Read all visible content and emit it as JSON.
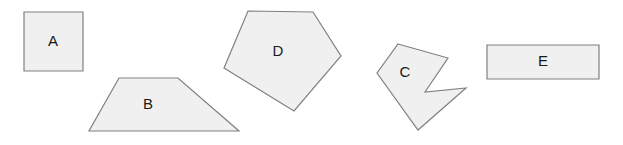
{
  "canvas": {
    "width": 623,
    "height": 145,
    "background_color": "#ffffff"
  },
  "style": {
    "fill_color": "#f0f0f0",
    "stroke_color": "#808080",
    "stroke_width": 1.2,
    "label_color": "#1a1a1a",
    "label_font_size": 15
  },
  "shapes": [
    {
      "id": "shape-a",
      "label": "A",
      "kind": "square",
      "points": "24,12 83,12 83,71 24,71",
      "label_x": 53,
      "label_y": 42
    },
    {
      "id": "shape-b",
      "label": "B",
      "kind": "trapezoid",
      "points": "119,78 178,78 239,131 89,131",
      "label_x": 148,
      "label_y": 105
    },
    {
      "id": "shape-d",
      "label": "D",
      "kind": "pentagon",
      "points": "248,11 313,12 341,56 294,111 224,68",
      "label_x": 278,
      "label_y": 52
    },
    {
      "id": "shape-c",
      "label": "C",
      "kind": "concave-arrow",
      "points": "398,44 448,58 425,92 466,88 418,130 377,73",
      "label_x": 405,
      "label_y": 73
    },
    {
      "id": "shape-e",
      "label": "E",
      "kind": "rectangle",
      "points": "487,45 599,45 599,79 487,79",
      "label_x": 543,
      "label_y": 62
    }
  ]
}
